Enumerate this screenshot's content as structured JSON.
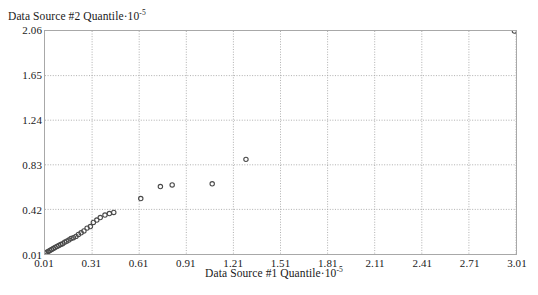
{
  "chart_data": {
    "type": "scatter",
    "title": "",
    "xlabel": "Data Source #1 Quantile·10⁻⁵",
    "ylabel": "Data Source #2 Quantile·10⁻⁵",
    "xlabel_text": "Data Source #1 Quantile",
    "xlabel_exp": "-5",
    "ylabel_text": "Data Source #2 Quantile",
    "ylabel_exp": "-5",
    "xlim": [
      0.01,
      3.01
    ],
    "ylim": [
      0.01,
      2.06
    ],
    "grid": true,
    "legend": "none",
    "marker": "open-circle",
    "marker_color": "#4a4a4a",
    "xticks": [
      "0.01",
      "0.31",
      "0.61",
      "0.91",
      "1.21",
      "1.51",
      "1.81",
      "2.11",
      "2.41",
      "2.71",
      "3.01"
    ],
    "xtick_values": [
      0.01,
      0.31,
      0.61,
      0.91,
      1.21,
      1.51,
      1.81,
      2.11,
      2.41,
      2.71,
      3.01
    ],
    "yticks": [
      "2.06",
      "1.65",
      "1.24",
      "0.83",
      "0.42",
      "0.01"
    ],
    "ytick_values": [
      2.06,
      1.65,
      1.24,
      0.83,
      0.42,
      0.01
    ],
    "points": [
      [
        0.012,
        0.018
      ],
      [
        0.022,
        0.027
      ],
      [
        0.031,
        0.034
      ],
      [
        0.041,
        0.043
      ],
      [
        0.052,
        0.052
      ],
      [
        0.063,
        0.06
      ],
      [
        0.074,
        0.07
      ],
      [
        0.086,
        0.08
      ],
      [
        0.098,
        0.088
      ],
      [
        0.11,
        0.097
      ],
      [
        0.122,
        0.105
      ],
      [
        0.135,
        0.118
      ],
      [
        0.148,
        0.128
      ],
      [
        0.162,
        0.138
      ],
      [
        0.176,
        0.152
      ],
      [
        0.191,
        0.16
      ],
      [
        0.207,
        0.172
      ],
      [
        0.223,
        0.19
      ],
      [
        0.24,
        0.205
      ],
      [
        0.258,
        0.222
      ],
      [
        0.278,
        0.248
      ],
      [
        0.299,
        0.262
      ],
      [
        0.318,
        0.3
      ],
      [
        0.34,
        0.322
      ],
      [
        0.362,
        0.345
      ],
      [
        0.392,
        0.368
      ],
      [
        0.42,
        0.382
      ],
      [
        0.448,
        0.392
      ],
      [
        0.62,
        0.52
      ],
      [
        0.745,
        0.63
      ],
      [
        0.82,
        0.645
      ],
      [
        1.075,
        0.655
      ],
      [
        1.29,
        0.88
      ],
      [
        3.0,
        2.06
      ]
    ]
  }
}
